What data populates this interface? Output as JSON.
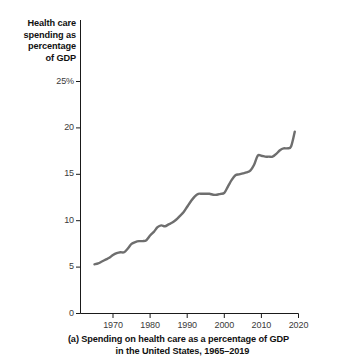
{
  "figure": {
    "caption_line1": "(a) Spending on health care as a percentage of GDP",
    "caption_line2": "in the United States, 1965–2019",
    "y_axis_title_lines": [
      "Health care",
      "spending as",
      "percentage",
      "of GDP"
    ],
    "line_color": "#6e6e6e",
    "axis_color": "#1a1a1a",
    "text_color": "#111111"
  },
  "chart_data": {
    "type": "line",
    "title": "(a) Spending on health care as a percentage of GDP in the United States, 1965–2019",
    "xlabel": "",
    "ylabel": "Health care spending as percentage of GDP",
    "xlim": [
      1964,
      2020
    ],
    "ylim": [
      0,
      25
    ],
    "xticks": [
      1970,
      1980,
      1990,
      2000,
      2010,
      2020
    ],
    "xtick_labels": [
      "1970",
      "1980",
      "1990",
      "2000",
      "2010",
      "2020"
    ],
    "yticks": [
      0,
      5,
      10,
      15,
      20,
      25
    ],
    "ytick_labels": [
      "0",
      "5",
      "10",
      "15",
      "20",
      "25%"
    ],
    "grid": false,
    "legend": "none",
    "series": [
      {
        "name": "Health care spending as percentage of GDP",
        "color": "#6e6e6e",
        "x": [
          1965,
          1966,
          1967,
          1968,
          1969,
          1970,
          1971,
          1972,
          1973,
          1974,
          1975,
          1976,
          1977,
          1978,
          1979,
          1980,
          1981,
          1982,
          1983,
          1984,
          1985,
          1986,
          1987,
          1988,
          1989,
          1990,
          1991,
          1992,
          1993,
          1994,
          1995,
          1996,
          1997,
          1998,
          1999,
          2000,
          2001,
          2002,
          2003,
          2004,
          2005,
          2006,
          2007,
          2008,
          2009,
          2010,
          2011,
          2012,
          2013,
          2014,
          2015,
          2016,
          2017,
          2018,
          2019
        ],
        "values": [
          5.3,
          5.4,
          5.6,
          5.8,
          6.0,
          6.3,
          6.5,
          6.6,
          6.6,
          7.0,
          7.5,
          7.7,
          7.8,
          7.8,
          7.9,
          8.4,
          8.8,
          9.3,
          9.5,
          9.4,
          9.6,
          9.8,
          10.1,
          10.5,
          10.9,
          11.5,
          12.1,
          12.6,
          12.9,
          12.9,
          12.9,
          12.9,
          12.8,
          12.8,
          12.9,
          13.0,
          13.7,
          14.4,
          14.9,
          15.0,
          15.1,
          15.2,
          15.4,
          16.0,
          17.0,
          17.0,
          16.9,
          16.9,
          16.9,
          17.2,
          17.6,
          17.8,
          17.8,
          18.0,
          19.6
        ]
      }
    ]
  }
}
